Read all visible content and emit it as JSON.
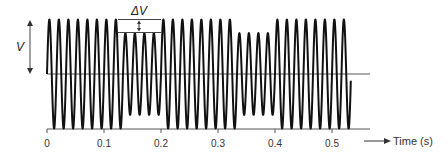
{
  "chart_data": {
    "type": "line",
    "title": "",
    "xlabel": "Time (s)",
    "ylabel": "",
    "xlim": [
      0,
      0.55
    ],
    "x_ticks": [
      0,
      0.1,
      0.2,
      0.3,
      0.4,
      0.5
    ],
    "x_tick_labels": [
      "0",
      "0.1",
      "0.2",
      "0.3",
      "0.4",
      "0.5"
    ],
    "grid": false,
    "legend": null,
    "series": [
      {
        "name": "AC voltage with sags",
        "frequency_hz": 60,
        "segments": [
          {
            "t_start": 0.0,
            "t_end": 0.133,
            "relative_amplitude": 1.0
          },
          {
            "t_start": 0.133,
            "t_end": 0.2,
            "relative_amplitude": 0.75
          },
          {
            "t_start": 0.2,
            "t_end": 0.333,
            "relative_amplitude": 1.0
          },
          {
            "t_start": 0.333,
            "t_end": 0.4,
            "relative_amplitude": 0.75
          },
          {
            "t_start": 0.4,
            "t_end": 0.533,
            "relative_amplitude": 1.0
          }
        ]
      }
    ],
    "annotations": [
      {
        "label": "V",
        "meaning": "full amplitude (peak above baseline)"
      },
      {
        "label": "ΔV",
        "meaning": "amplitude reduction during sag",
        "t": 0.15
      }
    ]
  },
  "labels": {
    "v": "V",
    "delta_v": "ΔV",
    "time_axis": "Time (s)",
    "ticks": [
      "0",
      "0.1",
      "0.2",
      "0.3",
      "0.4",
      "0.5"
    ]
  }
}
